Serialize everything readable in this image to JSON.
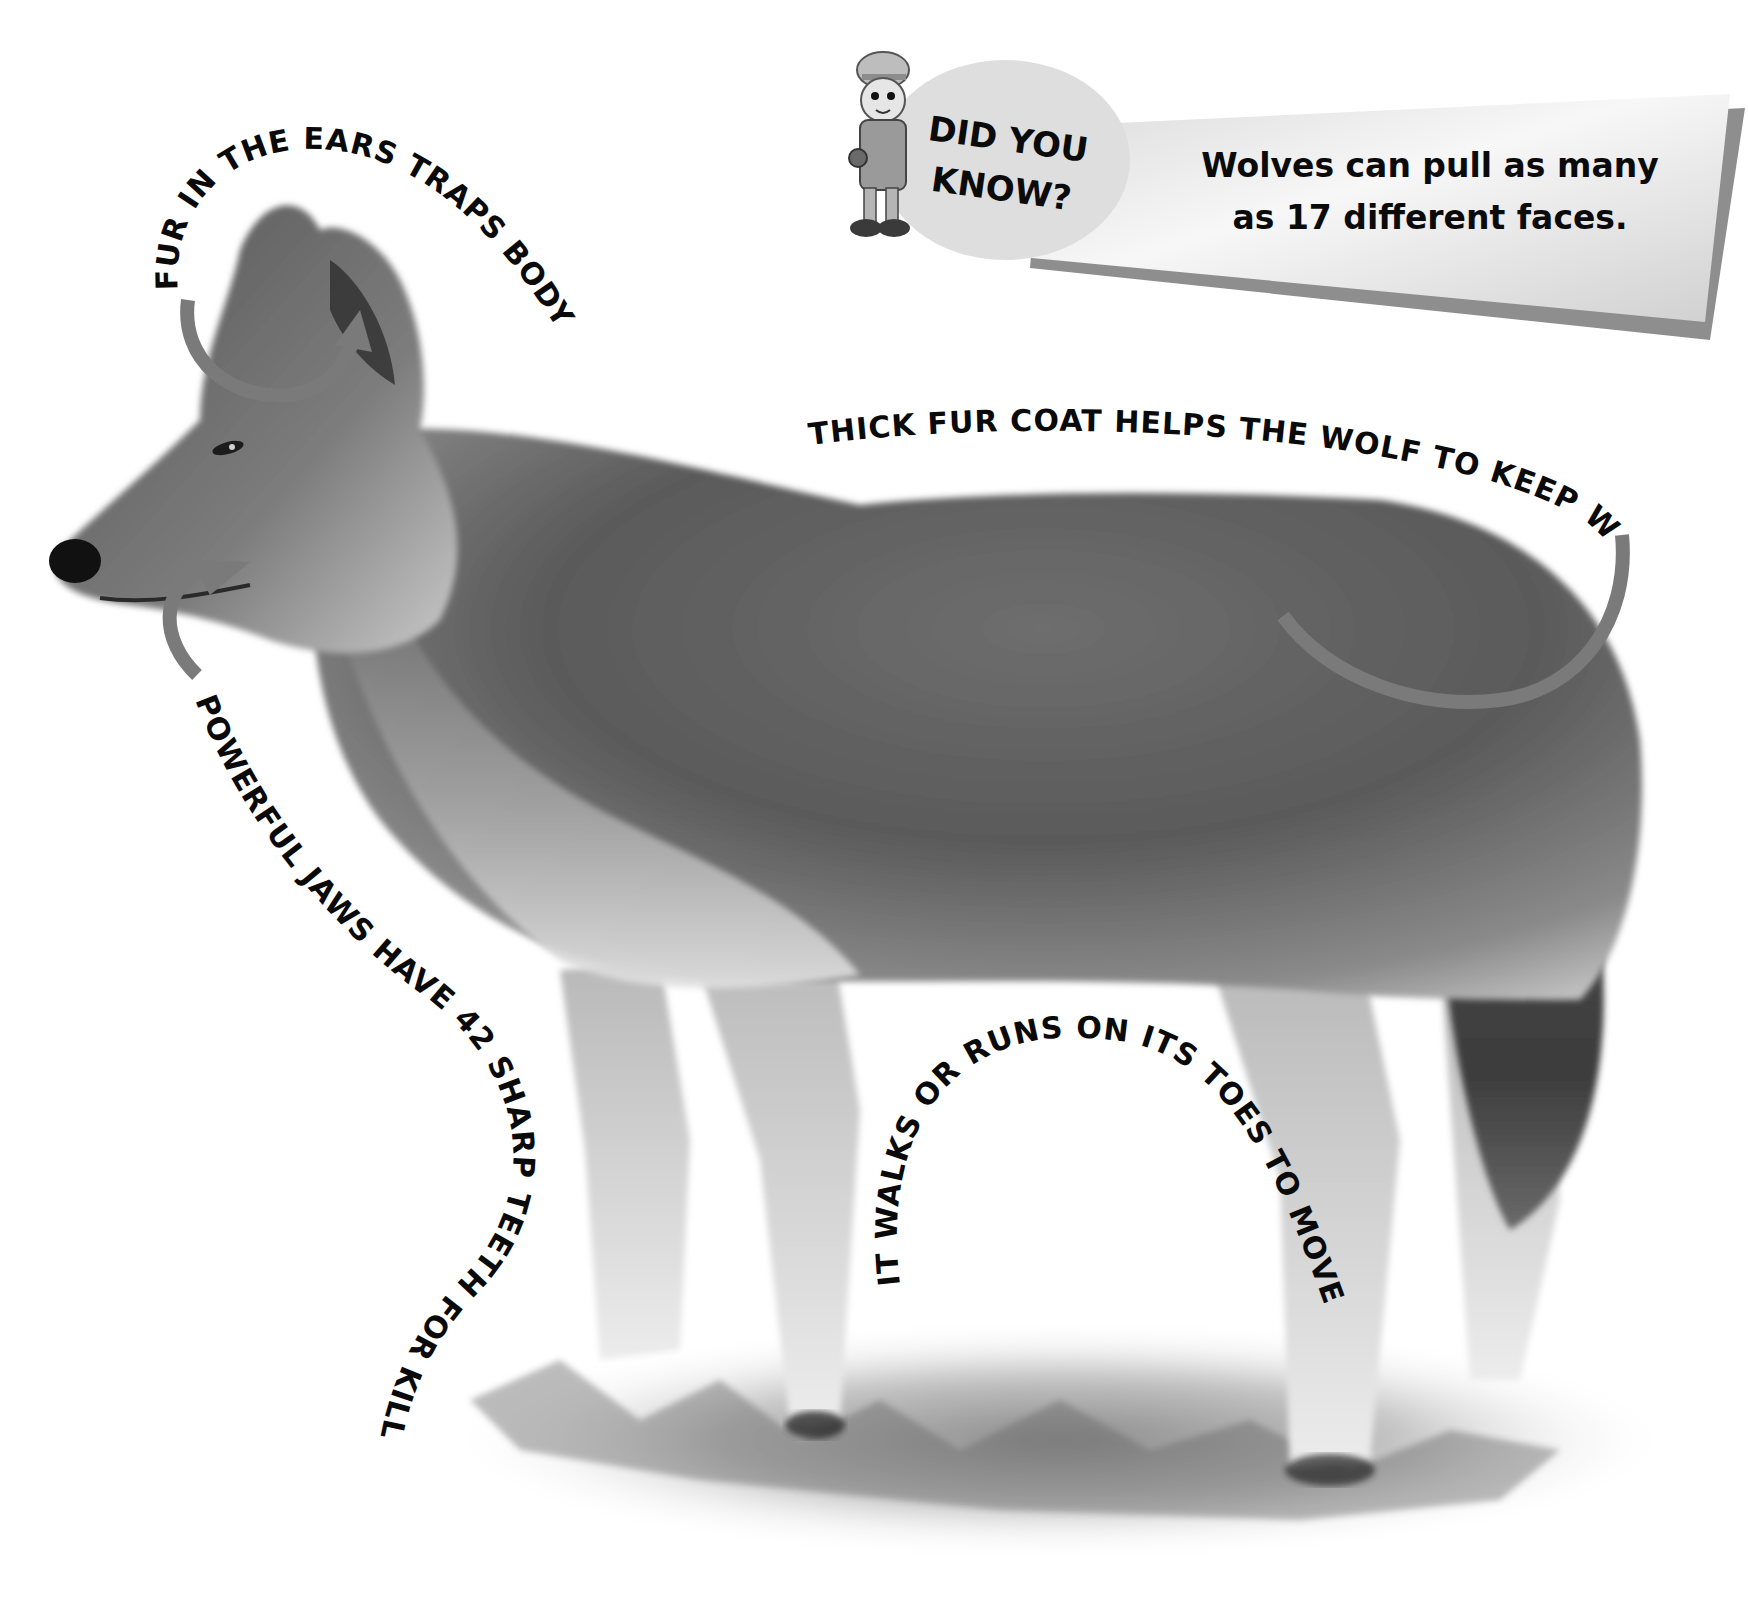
{
  "page": {
    "colors": {
      "background": "#ffffff",
      "text": "#0a0a0a",
      "arrow": "#7a7a7a",
      "banner_fill": "#e6e6e6",
      "banner_shadow": "#8e8e8e",
      "fur_dark": "#4a4a4a",
      "fur_mid": "#7d7d7d",
      "fur_light": "#d8d8d8"
    }
  },
  "did_you_know": {
    "heading_line1": "DID YOU",
    "heading_line2": "KNOW?",
    "fact_line1": "Wolves can pull as many",
    "fact_line2": "as 17 different faces.",
    "mascot": "explorer-mascot-icon"
  },
  "labels": {
    "ears": "FUR IN THE EARS TRAPS BODY HEAT",
    "coat": "THICK FUR COAT HELPS THE WOLF TO KEEP WARM.",
    "jaws": "POWERFUL JAWS HAVE 42 SHARP TEETH FOR KILLING PREY.",
    "toes": "IT WALKS OR RUNS ON ITS TOES TO MOVE FASTER."
  },
  "arrows": [
    {
      "name": "ear-arrow",
      "points_to": "ear"
    },
    {
      "name": "jaw-arrow",
      "points_to": "mouth"
    },
    {
      "name": "coat-arrow",
      "points_to": "back"
    }
  ]
}
